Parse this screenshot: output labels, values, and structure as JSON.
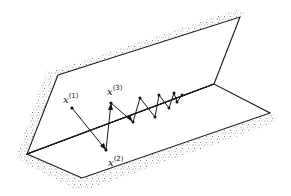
{
  "figure": {
    "colors": {
      "ink": "#1a1a1a",
      "background": "#ffffff",
      "stipple": "#7a7a7a"
    },
    "labels": [
      {
        "id": "x1",
        "base": "x",
        "sup": "(1)",
        "x": 63,
        "y": 100
      },
      {
        "id": "x3",
        "base": "x",
        "sup": "(3)",
        "x": 107,
        "y": 92
      },
      {
        "id": "x2",
        "base": "x",
        "sup": "(2)",
        "x": 110,
        "y": 166
      }
    ],
    "iterates": [
      {
        "id": "x1",
        "x": 72,
        "y": 108
      },
      {
        "id": "x2",
        "x": 106,
        "y": 150
      },
      {
        "id": "x3",
        "x": 111,
        "y": 103
      },
      {
        "x": 133,
        "y": 122
      },
      {
        "x": 140,
        "y": 98
      },
      {
        "x": 155,
        "y": 117
      },
      {
        "x": 159,
        "y": 95
      },
      {
        "x": 169,
        "y": 108
      },
      {
        "x": 174,
        "y": 93
      },
      {
        "x": 177,
        "y": 102
      },
      {
        "x": 182,
        "y": 95
      }
    ],
    "planes": {
      "back": [
        [
          58,
          75
        ],
        [
          240,
          17
        ],
        [
          214,
          84
        ],
        [
          27,
          154
        ]
      ],
      "bottom": [
        [
          27,
          154
        ],
        [
          214,
          84
        ],
        [
          270,
          113
        ],
        [
          82,
          178
        ]
      ]
    },
    "ridge": [
      [
        27,
        154
      ],
      [
        214,
        84
      ]
    ]
  }
}
